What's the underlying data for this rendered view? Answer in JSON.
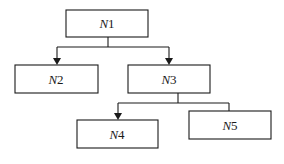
{
  "diagram": {
    "type": "tree",
    "nodes": [
      {
        "id": "N1",
        "var": "N",
        "sub": "1",
        "x": 66,
        "y": 10,
        "w": 82,
        "h": 27
      },
      {
        "id": "N2",
        "var": "N",
        "sub": "2",
        "x": 15,
        "y": 65,
        "w": 83,
        "h": 28
      },
      {
        "id": "N3",
        "var": "N",
        "sub": "3",
        "x": 128,
        "y": 65,
        "w": 82,
        "h": 28
      },
      {
        "id": "N4",
        "var": "N",
        "sub": "4",
        "x": 77,
        "y": 120,
        "w": 81,
        "h": 28
      },
      {
        "id": "N5",
        "var": "N",
        "sub": "5",
        "x": 189,
        "y": 111,
        "w": 82,
        "h": 28
      }
    ],
    "edges": [
      {
        "from": "N1",
        "to": "N2",
        "arrow": true
      },
      {
        "from": "N1",
        "to": "N3",
        "arrow": true
      },
      {
        "from": "N3",
        "to": "N4",
        "arrow": true
      },
      {
        "from": "N3",
        "to": "N5",
        "arrow": false
      }
    ]
  }
}
